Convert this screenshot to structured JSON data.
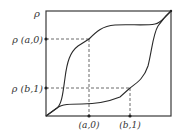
{
  "diagram": {
    "type": "hysteresis-loop",
    "y_axis_label": "ρ",
    "y_markers": [
      {
        "label": "ρ (a,0)",
        "y": 39
      },
      {
        "label": "ρ (b,1)",
        "y": 88
      }
    ],
    "x_markers": [
      {
        "label": "(a,0)",
        "x": 89
      },
      {
        "label": "(b,1)",
        "x": 130
      }
    ],
    "frame": {
      "x0": 46,
      "y0": 11,
      "x1": 171,
      "y1": 116
    },
    "curves": [
      {
        "name": "upper-branch",
        "passes_through": "(a,0), ρ(a,0)"
      },
      {
        "name": "lower-branch",
        "passes_through": "(b,1), ρ(b,1)"
      }
    ],
    "colors": {
      "line": "#2a2a2a",
      "frame": "#3a3a3a",
      "background": "#ffffff"
    }
  }
}
